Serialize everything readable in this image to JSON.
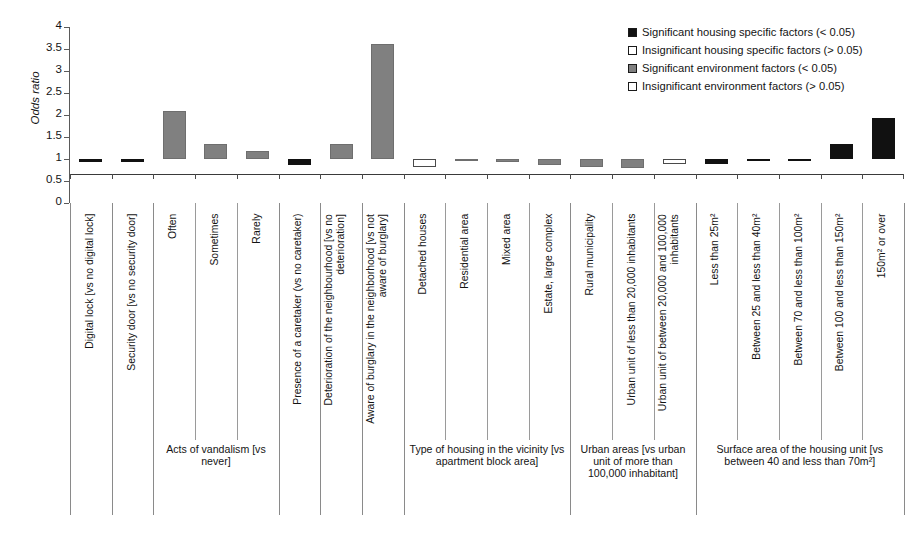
{
  "chart_data": {
    "type": "bar",
    "title": "",
    "xlabel": "",
    "ylabel": "Odds ratio",
    "ylim": [
      0,
      4
    ],
    "yticks": [
      "0",
      "0.5",
      "1",
      "1.5",
      "2",
      "2.5",
      "3",
      "3.5",
      "4"
    ],
    "reference_line": 1,
    "grid": false,
    "legend_position": "top-right",
    "categories": [
      "Digital lock [vs no digital lock]",
      "Security door [vs no security door]",
      "Often",
      "Sometimes",
      "Rarely",
      "Presence of a caretaker (vs no caretaker)",
      "Deterioration of the neighbourhood [vs no deterioration]",
      "Aware of burglary in the neighborhood [vs not aware of burglary]",
      "Detached houses",
      "Residential area",
      "Mixed area",
      "Estate, large complex",
      "Rural municipality",
      "Urban unit of less than 20,000 inhabitants",
      "Urban unit of between 20,000 and 100,000 inhabitants",
      "Less than 25m²",
      "Between 25 and less than 40m²",
      "Between 70 and less than 100m²",
      "Between 100 and less than 150m²",
      "150m² or over"
    ],
    "values": [
      0.93,
      0.93,
      2.09,
      1.35,
      1.19,
      0.87,
      1.33,
      3.61,
      0.82,
      1.01,
      0.94,
      0.86,
      0.82,
      0.79,
      0.88,
      0.89,
      1.01,
      1.0,
      1.34,
      1.93
    ],
    "series_keys": [
      "sig-house",
      "sig-house",
      "sig-env",
      "sig-env",
      "sig-env",
      "sig-house",
      "sig-env",
      "sig-env",
      "insig-env",
      "sig-env",
      "sig-env",
      "sig-env",
      "sig-env",
      "sig-env",
      "insig-env",
      "sig-house",
      "sig-house",
      "sig-house",
      "sig-house",
      "sig-house"
    ],
    "groups": [
      {
        "label": "",
        "start": 0,
        "end": 1
      },
      {
        "label": "",
        "start": 1,
        "end": 2
      },
      {
        "label": "Acts of vandalism [vs never]",
        "start": 2,
        "end": 5
      },
      {
        "label": "",
        "start": 5,
        "end": 6
      },
      {
        "label": "",
        "start": 6,
        "end": 7
      },
      {
        "label": "",
        "start": 7,
        "end": 8
      },
      {
        "label": "Type of housing in the vicinity [vs apartment block area]",
        "start": 8,
        "end": 12
      },
      {
        "label": "Urban areas [vs urban unit of more than 100,000 inhabitant]",
        "start": 12,
        "end": 15
      },
      {
        "label": "Surface area of the housing unit [vs between 40 and less than 70m²]",
        "start": 15,
        "end": 20
      }
    ]
  },
  "legend": {
    "items": [
      {
        "label": "Significant housing specific factors (< 0.05)",
        "key": "sig-house",
        "color": "#111111"
      },
      {
        "label": "Insignificant housing specific factors (> 0.05)",
        "key": "insig-house",
        "color": "#ffffff"
      },
      {
        "label": "Significant environment factors (< 0.05)",
        "key": "sig-env",
        "color": "#808080"
      },
      {
        "label": "Insignificant environment factors (> 0.05)",
        "key": "insig-env",
        "color": "#ffffff"
      }
    ]
  }
}
